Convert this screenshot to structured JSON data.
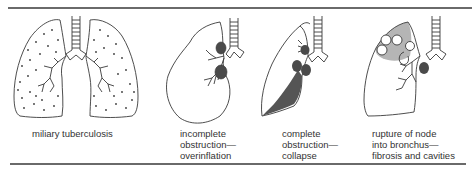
{
  "figure": {
    "panels": [
      {
        "id": "miliary",
        "caption_lines": [
          "miliary tuberculosis"
        ]
      },
      {
        "id": "overinflation",
        "caption_lines": [
          "incomplete",
          "obstruction—",
          "overinflation"
        ]
      },
      {
        "id": "collapse",
        "caption_lines": [
          "complete",
          "obstruction—",
          "collapse"
        ]
      },
      {
        "id": "cavities",
        "caption_lines": [
          "rupture of node",
          "into bronchus—",
          "fibrosis and cavities"
        ]
      }
    ],
    "colors": {
      "line": "#3a3a3a",
      "node_fill": "#4a4a4a",
      "collapse_fill": "#555555",
      "fibrosis_fill": "#b5b5b5",
      "rule": "#6a6a6a"
    }
  }
}
